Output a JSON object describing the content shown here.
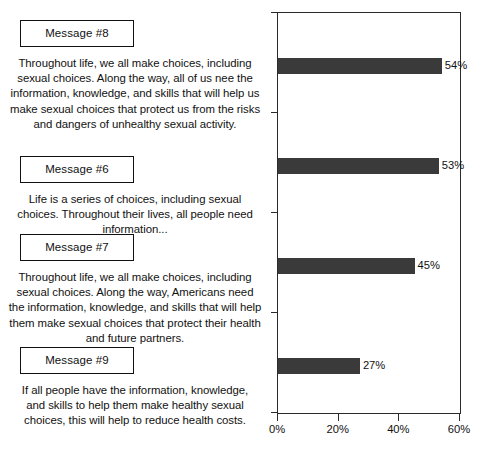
{
  "messages": [
    {
      "label": "Message #8",
      "body": "Throughout life, we all make choices, including sexual choices. Along the way, all of us nee the information, knowledge, and skills that will help us make sexual choices that protect us from the risks and dangers of unhealthy sexual activity."
    },
    {
      "label": "Message #6",
      "body": "Life is a series of choices, including sexual choices. Throughout their lives, all people need information..."
    },
    {
      "label": "Message #7",
      "body": "Throughout life, we all make choices, including sexual choices. Along the way, Americans need the information, knowledge, and skills that will help them make sexual choices that protect their health and future partners."
    },
    {
      "label": "Message #9",
      "body": "If all people have the information, knowledge, and skills to help them make healthy sexual choices, this will help to reduce health costs."
    }
  ],
  "chart_data": {
    "type": "bar",
    "orientation": "horizontal",
    "title": "",
    "xlabel": "",
    "ylabel": "",
    "categories": [
      "Message #8",
      "Message #6",
      "Message #7",
      "Message #9"
    ],
    "values": [
      54,
      53,
      45,
      27
    ],
    "value_labels": [
      "54%",
      "53%",
      "45%",
      "27%"
    ],
    "xlim": [
      0,
      60
    ],
    "xticks": [
      0,
      20,
      40,
      60
    ],
    "xticklabels": [
      "0%",
      "20%",
      "40%",
      "60%"
    ],
    "grid": false,
    "legend": false,
    "bar_color": "#3a3a3a",
    "frame_color": "#2a2a2a"
  }
}
